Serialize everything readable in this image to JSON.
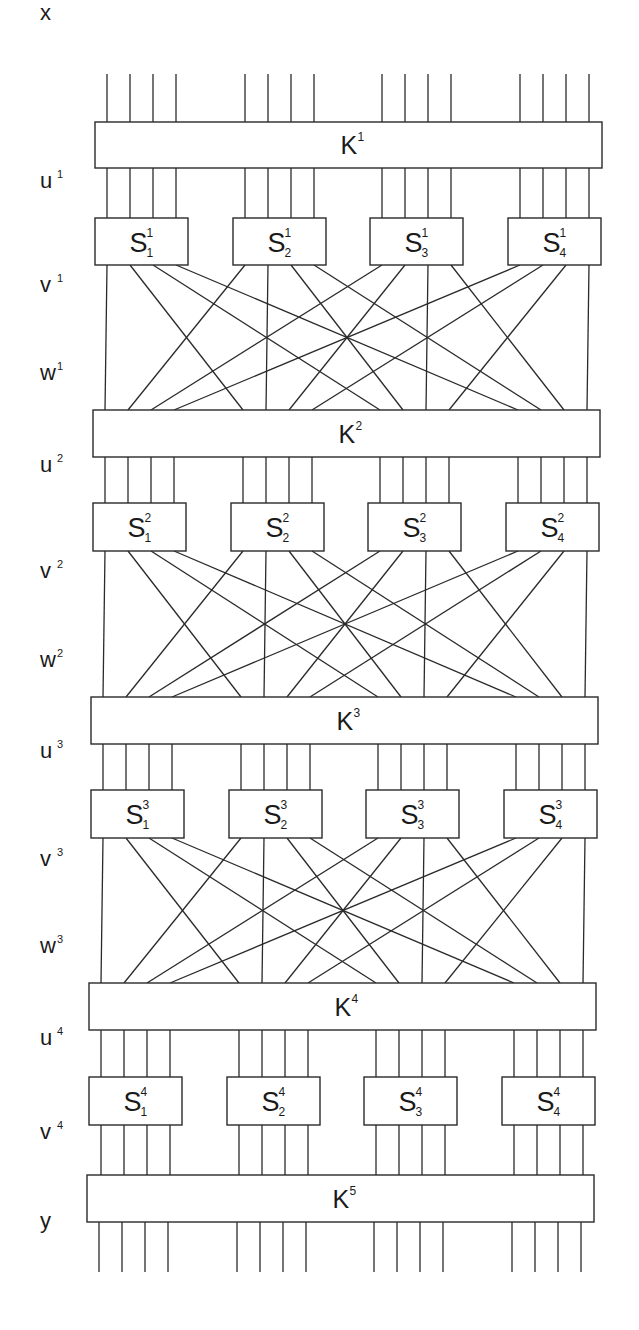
{
  "side_labels": [
    {
      "base": "x",
      "sup": "",
      "y": 20
    },
    {
      "base": "u",
      "sup": "1",
      "y": 188
    },
    {
      "base": "v",
      "sup": "1",
      "y": 292
    },
    {
      "base": "w",
      "sup": "1",
      "y": 380
    },
    {
      "base": "u",
      "sup": "2",
      "y": 472
    },
    {
      "base": "v",
      "sup": "2",
      "y": 578
    },
    {
      "base": "w",
      "sup": "2",
      "y": 667
    },
    {
      "base": "u",
      "sup": "3",
      "y": 758
    },
    {
      "base": "v",
      "sup": "3",
      "y": 866
    },
    {
      "base": "w",
      "sup": "3",
      "y": 953
    },
    {
      "base": "u",
      "sup": "4",
      "y": 1045
    },
    {
      "base": "v",
      "sup": "4",
      "y": 1139
    },
    {
      "base": "y",
      "sup": "",
      "y": 1228
    }
  ],
  "key_boxes": [
    {
      "label": "K",
      "sup": "1",
      "x": 95,
      "y": 122,
      "w": 507,
      "h": 46
    },
    {
      "label": "K",
      "sup": "2",
      "x": 93,
      "y": 410,
      "w": 507,
      "h": 47
    },
    {
      "label": "K",
      "sup": "3",
      "x": 91,
      "y": 697,
      "w": 507,
      "h": 47
    },
    {
      "label": "K",
      "sup": "4",
      "x": 89,
      "y": 983,
      "w": 507,
      "h": 47
    },
    {
      "label": "K",
      "sup": "5",
      "x": 87,
      "y": 1175,
      "w": 507,
      "h": 47
    }
  ],
  "sbox_rows": [
    {
      "round": "1",
      "y": 218,
      "h": 47,
      "xs": [
        95,
        233,
        370,
        508
      ],
      "w": 93
    },
    {
      "round": "2",
      "y": 503,
      "h": 48,
      "xs": [
        93,
        231,
        368,
        506
      ],
      "w": 93
    },
    {
      "round": "3",
      "y": 790,
      "h": 48,
      "xs": [
        91,
        229,
        366,
        504
      ],
      "w": 93
    },
    {
      "round": "4",
      "y": 1077,
      "h": 48,
      "xs": [
        89,
        227,
        364,
        502
      ],
      "w": 93
    }
  ],
  "sbox_labels": [
    "S",
    "S",
    "S",
    "S"
  ],
  "sbox_subscripts": [
    "1",
    "2",
    "3",
    "4"
  ],
  "wire_offsets": [
    12,
    35,
    58,
    81
  ],
  "permutation": [
    0,
    4,
    8,
    12,
    1,
    5,
    9,
    13,
    2,
    6,
    10,
    14,
    3,
    7,
    11,
    15
  ],
  "input_wire_top": 74,
  "output_wire_bottom": 1272,
  "colors": {
    "stroke": "#2a2a2a",
    "text": "#1a1a1a",
    "background": "#ffffff"
  }
}
